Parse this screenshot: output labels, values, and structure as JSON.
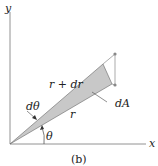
{
  "figure": {
    "caption": "(b)",
    "axes": {
      "x_label": "x",
      "y_label": "y"
    },
    "labels": {
      "outer_radius": "r + dr",
      "inner_radius": "r",
      "angle_increment": "dθ",
      "angle": "θ",
      "area_element": "dA"
    },
    "colors": {
      "wedge_fill": "#c8c8c8",
      "line": "#555555",
      "point": "#888888"
    }
  }
}
